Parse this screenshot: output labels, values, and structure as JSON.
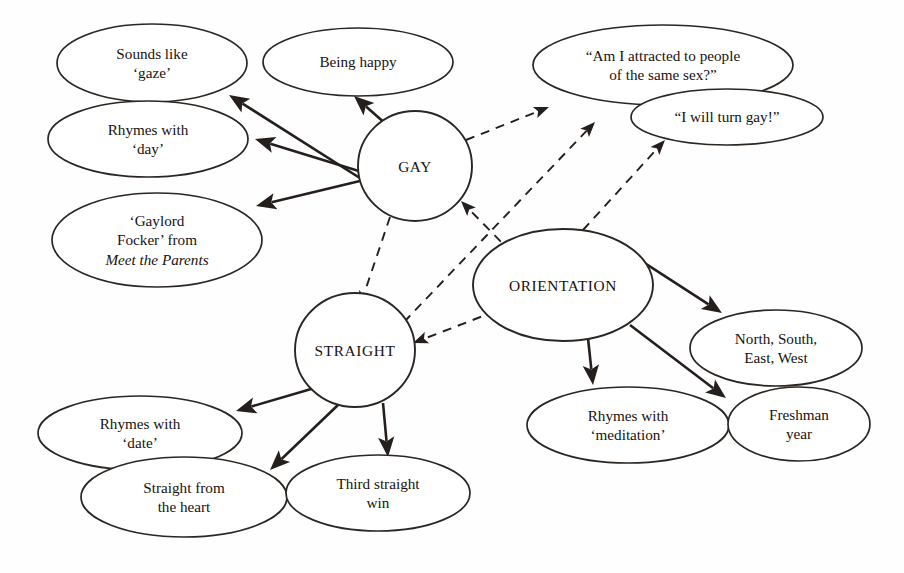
{
  "diagram": {
    "background_color": "#fefefe",
    "ink_color": "#241f1c",
    "hubs": [
      {
        "id": "gay",
        "label": "GAY",
        "cx": 415,
        "cy": 166,
        "rx": 57,
        "ry": 55
      },
      {
        "id": "straight",
        "label": "STRAIGHT",
        "cx": 355,
        "cy": 350,
        "rx": 60,
        "ry": 57
      },
      {
        "id": "orientation",
        "label": "ORIENTATION",
        "cx": 563,
        "cy": 285,
        "rx": 90,
        "ry": 56
      }
    ],
    "nodes": [
      {
        "id": "gaze",
        "cx": 152,
        "cy": 63,
        "rx": 95,
        "ry": 39,
        "lines": [
          "Sounds like",
          "‘gaze’"
        ]
      },
      {
        "id": "happy",
        "cx": 358,
        "cy": 62,
        "rx": 95,
        "ry": 34,
        "lines": [
          "Being happy"
        ]
      },
      {
        "id": "day",
        "cx": 148,
        "cy": 139,
        "rx": 100,
        "ry": 38,
        "lines": [
          "Rhymes with",
          "‘day’"
        ]
      },
      {
        "id": "gaylord",
        "cx": 157,
        "cy": 240,
        "rx": 105,
        "ry": 47,
        "lines": [
          "‘Gaylord",
          "Focker’ from",
          "Meet the Parents"
        ],
        "italic_last": true
      },
      {
        "id": "attracted",
        "cx": 663,
        "cy": 65,
        "rx": 130,
        "ry": 40,
        "lines": [
          "“Am I attracted to people",
          "of the same sex?”"
        ]
      },
      {
        "id": "turngay",
        "cx": 727,
        "cy": 117,
        "rx": 96,
        "ry": 28,
        "lines": [
          "“I will turn gay!”"
        ]
      },
      {
        "id": "compass",
        "cx": 776,
        "cy": 348,
        "rx": 86,
        "ry": 38,
        "lines": [
          "North, South,",
          "East, West"
        ]
      },
      {
        "id": "meditation",
        "cx": 628,
        "cy": 425,
        "rx": 101,
        "ry": 38,
        "lines": [
          "Rhymes with",
          "‘meditation’"
        ]
      },
      {
        "id": "freshman",
        "cx": 799,
        "cy": 424,
        "rx": 71,
        "ry": 37,
        "lines": [
          "Freshman",
          "year"
        ]
      },
      {
        "id": "date",
        "cx": 140,
        "cy": 433,
        "rx": 102,
        "ry": 37,
        "lines": [
          "Rhymes with",
          "‘date’"
        ]
      },
      {
        "id": "heart",
        "cx": 184,
        "cy": 497,
        "rx": 103,
        "ry": 40,
        "lines": [
          "Straight from",
          "the heart"
        ]
      },
      {
        "id": "thirdwin",
        "cx": 378,
        "cy": 493,
        "rx": 92,
        "ry": 38,
        "lines": [
          "Third straight",
          "win"
        ]
      }
    ],
    "edges_solid": [
      {
        "from": "gay",
        "to": "gaze",
        "x1": 363,
        "y1": 180,
        "x2": 229,
        "y2": 95
      },
      {
        "from": "gay",
        "to": "day",
        "x1": 362,
        "y1": 172,
        "x2": 255,
        "y2": 139
      },
      {
        "from": "gay",
        "to": "gaylord",
        "x1": 364,
        "y1": 180,
        "x2": 256,
        "y2": 206
      },
      {
        "from": "gay",
        "to": "happy",
        "x1": 387,
        "y1": 125,
        "x2": 354,
        "y2": 96
      },
      {
        "from": "straight",
        "to": "date",
        "x1": 318,
        "y1": 387,
        "x2": 236,
        "y2": 411
      },
      {
        "from": "straight",
        "to": "heart",
        "x1": 338,
        "y1": 405,
        "x2": 270,
        "y2": 470
      },
      {
        "from": "straight",
        "to": "thirdwin",
        "x1": 383,
        "y1": 403,
        "x2": 388,
        "y2": 457
      },
      {
        "from": "orientation",
        "to": "compass",
        "x1": 626,
        "y1": 251,
        "x2": 722,
        "y2": 313
      },
      {
        "from": "orientation",
        "to": "meditation",
        "x1": 588,
        "y1": 338,
        "x2": 593,
        "y2": 385
      },
      {
        "from": "orientation",
        "to": "freshman",
        "x1": 630,
        "y1": 325,
        "x2": 726,
        "y2": 398
      }
    ],
    "edges_dashed": [
      {
        "from": "gay",
        "to": "straight",
        "x1": 390,
        "y1": 217,
        "x2": 360,
        "y2": 306
      },
      {
        "from": "gay",
        "to": "attracted",
        "x1": 466,
        "y1": 140,
        "x2": 549,
        "y2": 107
      },
      {
        "from": "straight",
        "to": "attracted",
        "x1": 404,
        "y1": 322,
        "x2": 595,
        "y2": 122
      },
      {
        "from": "orientation",
        "to": "gay",
        "x1": 512,
        "y1": 253,
        "x2": 461,
        "y2": 201
      },
      {
        "from": "orientation",
        "to": "straight",
        "x1": 496,
        "y1": 311,
        "x2": 413,
        "y2": 343
      },
      {
        "from": "orientation",
        "to": "turngay",
        "x1": 583,
        "y1": 230,
        "x2": 665,
        "y2": 140
      }
    ]
  }
}
